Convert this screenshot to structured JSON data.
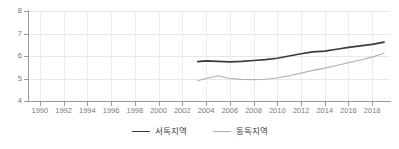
{
  "chart_data": {
    "type": "line",
    "title": "",
    "subtitle": "",
    "xlabel": "",
    "ylabel": "",
    "xlim": [
      1989,
      2019.5
    ],
    "ylim": [
      4,
      8
    ],
    "y_ticks": [
      4,
      5,
      6,
      7,
      8
    ],
    "x_ticks": [
      1990,
      1992,
      1994,
      1996,
      1998,
      2000,
      2002,
      2004,
      2006,
      2008,
      2010,
      2012,
      2014,
      2016,
      2018
    ],
    "x_tick_labels": [
      "1990",
      "1992",
      "1994",
      "1996",
      "1998",
      "2000",
      "2002",
      "2004",
      "2006",
      "2008",
      "2010",
      "2012",
      "2014",
      "2016",
      "2018"
    ],
    "y_tick_labels": [
      "4",
      "5",
      "6",
      "7",
      "8"
    ],
    "grid": true,
    "grid_color": "#e8e8e8",
    "legend_position": "bottom",
    "axis_color": "#9a9a9a",
    "tick_label_color": "#7a7a7a",
    "background_color": "#ffffff",
    "x": [
      2003.3,
      2004,
      2005,
      2006,
      2007,
      2008,
      2009,
      2010,
      2011,
      2012,
      2013,
      2014,
      2015,
      2016,
      2017,
      2018,
      2019
    ],
    "series": [
      {
        "name": "서독지역",
        "color": "#3b3b3b",
        "values": [
          5.75,
          5.78,
          5.76,
          5.74,
          5.76,
          5.8,
          5.84,
          5.9,
          6.0,
          6.1,
          6.18,
          6.22,
          6.3,
          6.38,
          6.45,
          6.52,
          6.62
        ]
      },
      {
        "name": "동독지역",
        "color": "#b0b0b0",
        "values": [
          4.9,
          5.0,
          5.12,
          5.0,
          4.96,
          4.95,
          4.97,
          5.02,
          5.12,
          5.24,
          5.36,
          5.46,
          5.58,
          5.7,
          5.82,
          5.95,
          6.12
        ]
      }
    ]
  },
  "legend": {
    "entries": [
      {
        "label": "서독지역",
        "color": "#3b3b3b"
      },
      {
        "label": "동독지역",
        "color": "#b0b0b0"
      }
    ]
  }
}
